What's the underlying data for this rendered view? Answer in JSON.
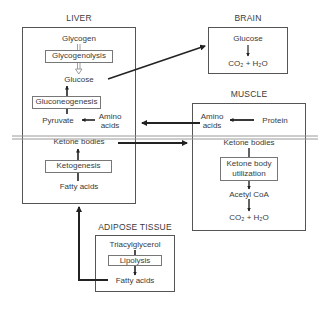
{
  "liver": {
    "title": "LIVER",
    "glycogen": "Glycogen",
    "glycogenolysis": "Glycogenolysis",
    "glucose": "Glucose",
    "gluconeogenesis": "Gluconeogenesis",
    "pyruvate": "Pyruvate",
    "amino_acids_1": "Amino",
    "amino_acids_2": "acids",
    "ketone_bodies": "Ketone bodies",
    "ketogenesis": "Ketogenesis",
    "fatty_acids": "Fatty acids"
  },
  "brain": {
    "title": "BRAIN",
    "glucose": "Glucose",
    "products": "CO₂ + H₂O"
  },
  "muscle": {
    "title": "MUSCLE",
    "amino_acids_1": "Amino",
    "amino_acids_2": "acids",
    "protein": "Protein",
    "ketone_bodies": "Ketone bodies",
    "ketone_body_utilization_1": "Ketone body",
    "ketone_body_utilization_2": "utilization",
    "acetyl_coa": "Acetyl CoA",
    "products": "CO₂ + H₂O"
  },
  "adipose": {
    "title": "ADIPOSE TISSUE",
    "triacylglycerol": "Triacylglycerol",
    "lipolysis": "Lipolysis",
    "fatty_acids": "Fatty acids"
  }
}
